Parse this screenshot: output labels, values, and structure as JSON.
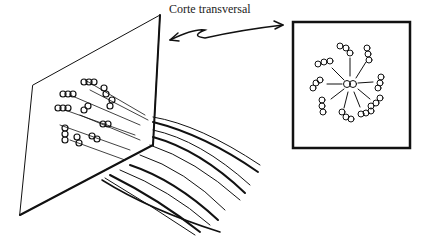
{
  "diagram": {
    "label": "Corte transversal",
    "colors": {
      "ink": "#111111",
      "background": "#ffffff"
    },
    "elements": {
      "plane": "cross-section plane cutting fiber bundle",
      "fibers": "bundle of elongated chain fibers",
      "inset": "cross-section view: central unit with radiating chains"
    }
  }
}
